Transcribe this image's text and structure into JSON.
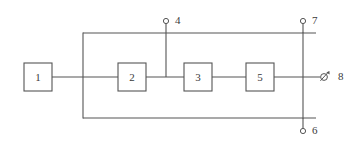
{
  "diagram": {
    "background_color": "#ffffff",
    "line_color": "#555555",
    "text_color": "#3a3a3a",
    "blocks": [
      {
        "id": "block-1",
        "label": "1",
        "x": 24,
        "y": 63,
        "w": 28,
        "h": 28
      },
      {
        "id": "block-2",
        "label": "2",
        "x": 118,
        "y": 63,
        "w": 28,
        "h": 28
      },
      {
        "id": "block-3",
        "label": "3",
        "x": 184,
        "y": 63,
        "w": 28,
        "h": 28
      },
      {
        "id": "block-5",
        "label": "5",
        "x": 246,
        "y": 63,
        "w": 28,
        "h": 28
      }
    ],
    "terminals": [
      {
        "id": "terminal-4",
        "label": "4",
        "symbol": "open-circle",
        "cx": 166,
        "cy": 21,
        "r": 2.6,
        "label_x": 175,
        "label_y": 21
      },
      {
        "id": "terminal-7",
        "label": "7",
        "symbol": "open-circle",
        "cx": 303,
        "cy": 21,
        "r": 2.6,
        "label_x": 312,
        "label_y": 21
      },
      {
        "id": "terminal-6",
        "label": "6",
        "symbol": "open-circle",
        "cx": 303,
        "cy": 131,
        "r": 2.6,
        "label_x": 312,
        "label_y": 131
      },
      {
        "id": "terminal-8",
        "label": "8",
        "symbol": "adjustable-slashed-circle",
        "cx": 324,
        "cy": 77,
        "r": 3.4,
        "label_x": 338,
        "label_y": 77
      }
    ],
    "wires": [
      {
        "id": "wire-block1-to-block2",
        "points": "52,77 118,77"
      },
      {
        "id": "wire-block2-to-block3",
        "points": "146,77 184,77"
      },
      {
        "id": "wire-block3-to-block5",
        "points": "212,77 246,77"
      },
      {
        "id": "wire-block5-to-terminal8",
        "points": "274,77 320,77"
      },
      {
        "id": "wire-top-rail",
        "points": "83,33 316,33"
      },
      {
        "id": "wire-bottom-rail",
        "points": "83,118 316,118"
      },
      {
        "id": "wire-left-bus",
        "points": "83,33 83,118"
      },
      {
        "id": "wire-right-bus",
        "points": "303,33 303,118"
      },
      {
        "id": "wire-terminal4-drop",
        "points": "166,21 166,77"
      },
      {
        "id": "wire-terminal7-stem",
        "points": "303,21 303,33"
      },
      {
        "id": "wire-terminal6-stem",
        "points": "303,118 303,131"
      }
    ]
  }
}
